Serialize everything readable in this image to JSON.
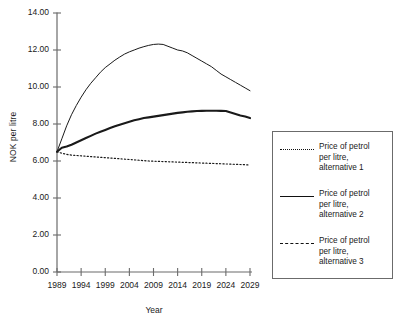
{
  "chart_data": {
    "type": "line",
    "title": "",
    "xlabel": "Year",
    "ylabel": "NOK per litre",
    "xlim": [
      1989,
      2029
    ],
    "ylim": [
      0.0,
      14.0
    ],
    "grid": false,
    "legend_position": "right",
    "x_ticks": [
      "1989",
      "1994",
      "1999",
      "2004",
      "2009",
      "2014",
      "2019",
      "2024",
      "2029"
    ],
    "y_ticks": [
      "0.00",
      "2.00",
      "4.00",
      "6.00",
      "8.00",
      "10.00",
      "12.00",
      "14.00"
    ],
    "x": [
      1989,
      1990,
      1991,
      1992,
      1993,
      1994,
      1995,
      1996,
      1997,
      1998,
      1999,
      2000,
      2001,
      2002,
      2003,
      2004,
      2005,
      2006,
      2007,
      2008,
      2009,
      2010,
      2011,
      2012,
      2013,
      2014,
      2015,
      2016,
      2017,
      2018,
      2019,
      2020,
      2021,
      2022,
      2023,
      2024,
      2025,
      2026,
      2027,
      2028,
      2029
    ],
    "series": [
      {
        "name": "Price of petrol per litre, alternative 1",
        "style": "dotted",
        "values": [
          6.5,
          6.42,
          6.36,
          6.32,
          6.3,
          6.28,
          6.26,
          6.24,
          6.22,
          6.2,
          6.18,
          6.16,
          6.14,
          6.12,
          6.1,
          6.08,
          6.06,
          6.04,
          6.02,
          6.0,
          5.99,
          5.98,
          5.97,
          5.96,
          5.95,
          5.94,
          5.93,
          5.92,
          5.91,
          5.9,
          5.89,
          5.88,
          5.87,
          5.86,
          5.85,
          5.84,
          5.83,
          5.82,
          5.81,
          5.8,
          5.78
        ]
      },
      {
        "name": "Price of petrol per litre, alternative 2",
        "style": "solid-thin",
        "values": [
          6.5,
          7.2,
          7.9,
          8.5,
          9.0,
          9.45,
          9.85,
          10.2,
          10.5,
          10.8,
          11.05,
          11.25,
          11.45,
          11.62,
          11.78,
          11.9,
          12.0,
          12.1,
          12.18,
          12.25,
          12.3,
          12.32,
          12.3,
          12.2,
          12.1,
          12.0,
          11.95,
          11.85,
          11.7,
          11.55,
          11.4,
          11.25,
          11.1,
          10.9,
          10.7,
          10.55,
          10.4,
          10.25,
          10.1,
          9.95,
          9.8
        ]
      },
      {
        "name": "Price of petrol per litre, alternative 3",
        "style": "solid-thick",
        "values": [
          6.5,
          6.72,
          6.78,
          6.88,
          7.0,
          7.12,
          7.24,
          7.36,
          7.48,
          7.58,
          7.68,
          7.78,
          7.88,
          7.96,
          8.04,
          8.12,
          8.2,
          8.26,
          8.32,
          8.36,
          8.4,
          8.44,
          8.48,
          8.52,
          8.56,
          8.6,
          8.63,
          8.66,
          8.68,
          8.7,
          8.71,
          8.72,
          8.72,
          8.72,
          8.71,
          8.7,
          8.62,
          8.54,
          8.46,
          8.4,
          8.32
        ]
      }
    ]
  },
  "legend": {
    "entries": [
      {
        "key": "dotted",
        "label": "Price of petrol\nper litre,\nalternative 1"
      },
      {
        "key": "solid",
        "label": "Price of petrol\nper litre,\nalternative 2"
      },
      {
        "key": "dashed",
        "label": "Price of petrol\nper litre,\nalternative 3"
      }
    ]
  },
  "colors": {
    "axis": "#6b6b6b",
    "line": "#1a1a1a",
    "legend_border": "#6b6b6b",
    "background": "#ffffff"
  }
}
